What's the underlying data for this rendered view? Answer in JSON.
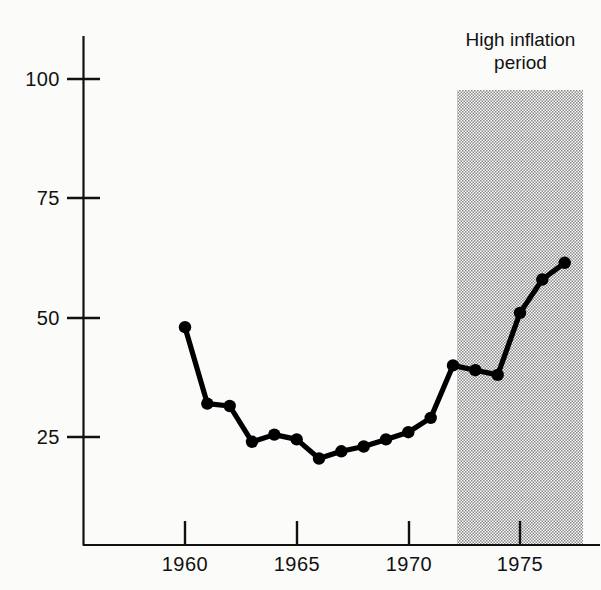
{
  "chart_data": {
    "type": "line",
    "title": "",
    "subtitle": "",
    "xlabel": "",
    "ylabel": "",
    "x": [
      1960,
      1961,
      1962,
      1963,
      1964,
      1965,
      1966,
      1967,
      1968,
      1969,
      1970,
      1971,
      1972,
      1973,
      1974,
      1975,
      1976,
      1977
    ],
    "values": [
      48,
      32,
      31.5,
      24,
      25.5,
      24.5,
      20.5,
      22,
      23,
      24.5,
      26,
      29,
      40,
      39,
      38,
      51,
      58,
      61.5
    ],
    "series": [
      {
        "name": "",
        "values": [
          48,
          32,
          31.5,
          24,
          25.5,
          24.5,
          20.5,
          22,
          23,
          24.5,
          26,
          29,
          40,
          39,
          38,
          51,
          58,
          61.5
        ]
      }
    ],
    "xlim": [
      1958.6,
      1978.2
    ],
    "ylim": [
      0,
      108
    ],
    "xticks": [
      1960,
      1965,
      1970,
      1975
    ],
    "xtick_labels": [
      "1960",
      "1965",
      "1970",
      "1975"
    ],
    "yticks": [
      25,
      50,
      75,
      100
    ],
    "ytick_labels": [
      "25",
      "50",
      "75",
      "100"
    ],
    "grid": false,
    "legend": null,
    "marker": "filled-circle",
    "line_color": "#000000",
    "marker_color": "#000000",
    "annotations": [
      {
        "name": "high-inflation-band",
        "label_lines": [
          "High inflation",
          "period"
        ],
        "label_text": "High inflation period",
        "type": "shaded-region",
        "x_start": 1972.2,
        "x_end": 1978.2,
        "y_start": 0,
        "y_end": 102,
        "fill": "#b3b3b3",
        "pattern": "dotted-halftone"
      }
    ]
  },
  "axis": {
    "y_tick_labels": [
      "100",
      "75",
      "50",
      "25"
    ],
    "x_tick_labels": [
      "1960",
      "1965",
      "1970",
      "1975"
    ]
  },
  "annotation": {
    "line1": "High inflation",
    "line2": "period"
  }
}
